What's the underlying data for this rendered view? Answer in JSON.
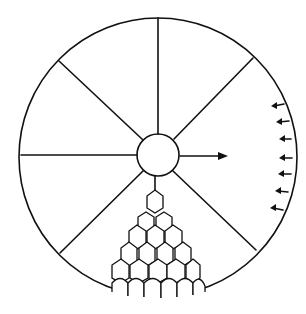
{
  "diagram": {
    "outer_circle": {
      "cx": 158,
      "cy": 157,
      "r": 139
    },
    "hub": {
      "cx": 158,
      "cy": 155,
      "r": 21
    },
    "spoke_count": 8,
    "center_arrow": {
      "direction": "right",
      "length": 45
    },
    "rim_arrows": {
      "count": 7,
      "direction": "inward-left",
      "side": "right"
    },
    "cell_cluster": {
      "shape": "hexagonal",
      "rows": [
        1,
        2,
        3,
        4,
        5,
        6
      ],
      "position": "bottom sector"
    },
    "colors": {
      "line": "#111111",
      "background": "#ffffff"
    }
  }
}
